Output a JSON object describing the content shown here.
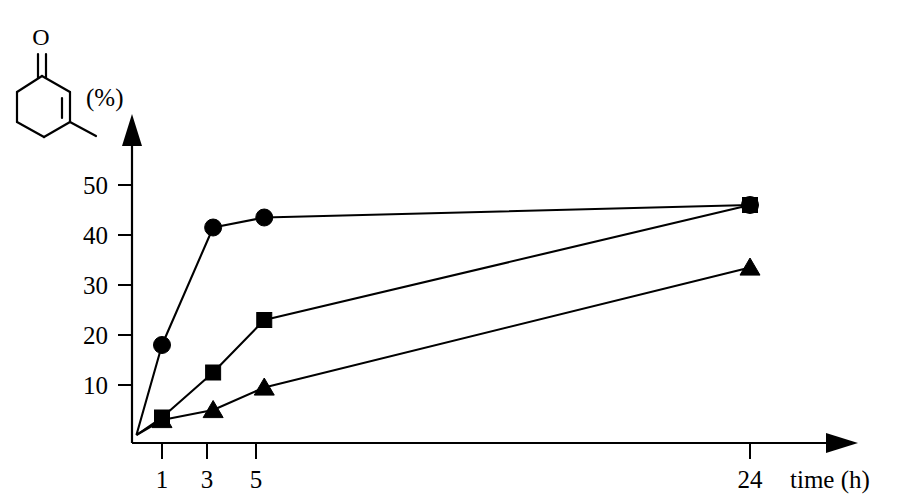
{
  "figure": {
    "molecule": {
      "name": "3-methylcyclohex-2-en-1-one",
      "oxygen_label": "O"
    },
    "y_unit_label": "(%)",
    "x_axis_label": "time (h)"
  },
  "chart_data": {
    "type": "line",
    "title": "",
    "xlabel": "time (h)",
    "ylabel": "(%)",
    "ylim": [
      0,
      55
    ],
    "xlim": [
      0,
      26
    ],
    "grid": false,
    "legend": "none",
    "x_ticks": [
      1,
      3,
      5,
      24
    ],
    "x_tick_labels": [
      "1",
      "3",
      "5",
      "24"
    ],
    "y_ticks": [
      10,
      20,
      30,
      40,
      50
    ],
    "y_tick_labels": [
      "10",
      "20",
      "30",
      "40",
      "50"
    ],
    "x": [
      0,
      1,
      3,
      5,
      24
    ],
    "series": [
      {
        "name": "circle-series",
        "marker": "circle",
        "values": [
          0,
          18,
          41.5,
          43.5,
          46
        ]
      },
      {
        "name": "square-series",
        "marker": "square",
        "values": [
          0,
          3.5,
          12.5,
          23,
          46
        ]
      },
      {
        "name": "triangle-series",
        "marker": "triangle",
        "values": [
          0,
          3,
          5,
          9.5,
          33.5
        ]
      }
    ]
  }
}
